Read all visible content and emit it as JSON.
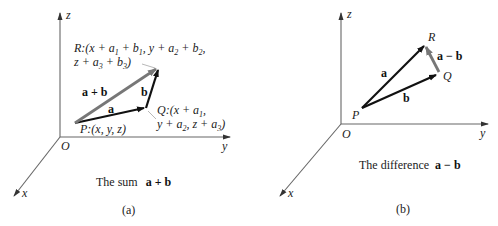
{
  "panel_a": {
    "axes": {
      "x": "x",
      "y": "y",
      "z": "z",
      "origin": "O"
    },
    "points": {
      "P": "P:(x, y, z)",
      "Q_line1": "Q:(x + a1,",
      "Q_line2": "y + a2, z + a3)",
      "R_line1": "R:(x + a1 + b1,  y + a2 + b2,",
      "R_line2": "z + a3 + b3)"
    },
    "vectors": {
      "a": "a",
      "b": "b",
      "sum": "a + b"
    },
    "caption": "The sum",
    "caption_bold": "a + b",
    "label": "(a)"
  },
  "panel_b": {
    "axes": {
      "x": "x",
      "y": "y",
      "z": "z",
      "origin": "O"
    },
    "points": {
      "P": "P",
      "Q": "Q",
      "R": "R"
    },
    "vectors": {
      "a": "a",
      "b": "b",
      "diff": "a − b"
    },
    "caption": "The difference",
    "caption_bold": "a − b",
    "label": "(b)"
  },
  "colors": {
    "axis": "#555555",
    "vector": "#111111",
    "result_vector": "#777777",
    "text": "#222222"
  }
}
